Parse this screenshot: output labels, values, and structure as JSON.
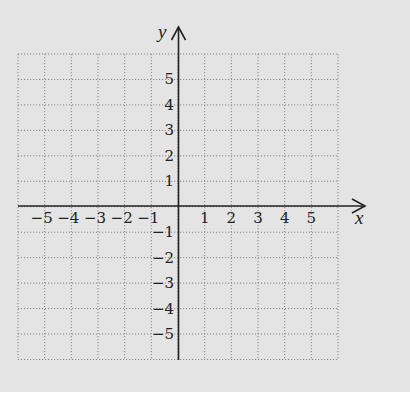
{
  "diagram": {
    "type": "coordinate-plane",
    "x_axis": {
      "label": "x",
      "min": -6,
      "max": 6,
      "tick_labels": [
        "-5",
        "-4",
        "-3",
        "-2",
        "-1",
        "1",
        "2",
        "3",
        "4",
        "5"
      ]
    },
    "y_axis": {
      "label": "y",
      "min": -6,
      "max": 6,
      "tick_labels": [
        "5",
        "4",
        "3",
        "2",
        "1",
        "-1",
        "-2",
        "-3",
        "-4",
        "-5"
      ]
    },
    "grid": {
      "style": "dotted",
      "columns": 12,
      "rows": 12
    },
    "colors": {
      "background": "#e4e4e4",
      "grid": "#8a8a8a",
      "axis": "#222222",
      "text": "#222222"
    }
  }
}
